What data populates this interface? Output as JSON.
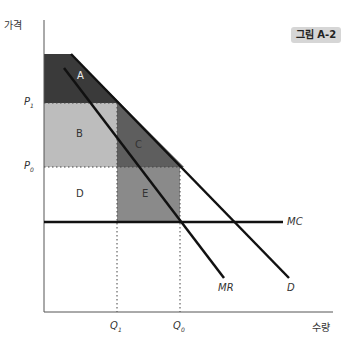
{
  "figure": {
    "badge": "그림 A-2",
    "y_axis_label": "가격",
    "x_axis_label": "수량",
    "price_labels": {
      "p1": "P",
      "p1_sub": "1",
      "p0": "P",
      "p0_sub": "0"
    },
    "quantity_labels": {
      "q1": "Q",
      "q1_sub": "1",
      "q0": "Q",
      "q0_sub": "0"
    },
    "curve_labels": {
      "mc": "MC",
      "mr": "MR",
      "d": "D"
    },
    "regions": {
      "a": "A",
      "b": "B",
      "c": "C",
      "d": "D",
      "e": "E"
    }
  },
  "colors": {
    "region_a": "#3a3a3a",
    "region_b": "#bdbdbd",
    "region_c": "#5e5e5e",
    "region_e": "#8a8a8a",
    "lines": "#111111"
  }
}
